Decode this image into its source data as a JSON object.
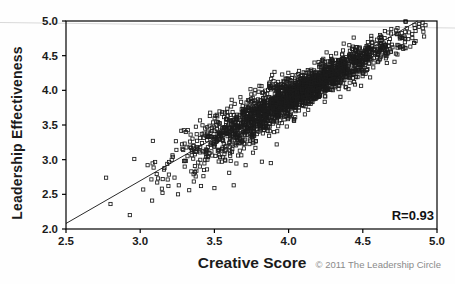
{
  "chart_data": {
    "type": "scatter",
    "title": "",
    "xlabel": "Creative Score",
    "ylabel": "Leadership Effectiveness",
    "xlim": [
      2.5,
      5.0
    ],
    "ylim": [
      2.0,
      5.0
    ],
    "grid": false,
    "x_tick_labels": [
      "2.5",
      "3.0",
      "3.5",
      "4.0",
      "4.5",
      "5.0"
    ],
    "y_tick_labels": [
      "2.0",
      "2.5",
      "3.0",
      "3.5",
      "4.0",
      "4.5",
      "5.0"
    ],
    "annotation": "R=0.93",
    "correlation": 0.93,
    "marker": {
      "shape": "open-square",
      "size_px": 3.2,
      "color": "#1c1c1c"
    },
    "trendline": {
      "x1": 2.5,
      "y1": 2.08,
      "x2": 4.87,
      "y2": 5.0,
      "color": "#2a2a2a"
    },
    "cloud_model": {
      "n": 2300,
      "seed": 7,
      "x_mean": 4.05,
      "x_sd": 0.34,
      "x_min": 3.05,
      "x_max": 4.93,
      "trend_x0": 4.05,
      "trend_y0": 3.94,
      "trend_slope": 1.15,
      "noise_sd_base": 0.12,
      "noise_sd_fan_x": 4.2,
      "noise_sd_fan_rate": 0.1,
      "y_min": 2.3,
      "y_max": 5.0
    },
    "outlier_points": [
      [
        2.77,
        2.74
      ],
      [
        2.8,
        2.36
      ],
      [
        2.93,
        2.2
      ],
      [
        2.96,
        3.01
      ],
      [
        3.02,
        2.57
      ],
      [
        3.05,
        2.92
      ],
      [
        3.08,
        2.41
      ],
      [
        3.12,
        2.73
      ],
      [
        3.15,
        2.52
      ],
      [
        3.19,
        2.62
      ],
      [
        3.22,
        3.04
      ],
      [
        3.26,
        2.63
      ],
      [
        3.3,
        2.9
      ],
      [
        3.33,
        2.56
      ],
      [
        3.36,
        2.79
      ],
      [
        3.41,
        2.62
      ],
      [
        3.45,
        2.86
      ],
      [
        3.5,
        2.59
      ],
      [
        3.55,
        2.97
      ],
      [
        3.6,
        2.81
      ],
      [
        3.63,
        2.63
      ],
      [
        3.66,
        3.06
      ],
      [
        3.71,
        2.92
      ],
      [
        3.76,
        3.1
      ],
      [
        3.82,
        2.97
      ],
      [
        3.88,
        2.95
      ],
      [
        3.92,
        3.22
      ],
      [
        3.48,
        3.12
      ],
      [
        3.38,
        3.18
      ],
      [
        3.58,
        3.2
      ]
    ]
  },
  "footer": {
    "copyright": "© 2011 The Leadership Circle"
  },
  "colors": {
    "axis": "#000000",
    "text": "#1b1b1b",
    "muted": "#8a8a8a",
    "artifact_line": "#d9d9d9",
    "background": "#fefefe"
  }
}
